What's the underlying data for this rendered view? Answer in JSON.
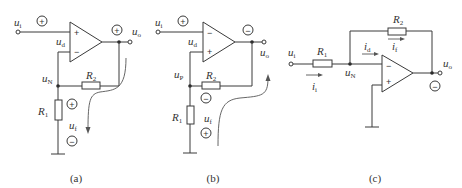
{
  "figure": {
    "panels": [
      {
        "id": "a",
        "caption": "(a)",
        "labels": {
          "input": "u",
          "input_sub": "i",
          "diff": "u",
          "diff_sub": "d",
          "node": "u",
          "node_sub": "N",
          "output": "u",
          "output_sub": "o",
          "r1": "R",
          "r1_sub": "1",
          "r2": "R",
          "r2_sub": "2",
          "feedback": "u",
          "feedback_sub": "f",
          "opamp_top": "+",
          "opamp_bottom": "−"
        },
        "polarity": {
          "input": "+",
          "output": "+",
          "feedback_top": "+",
          "feedback_bottom": "−"
        }
      },
      {
        "id": "b",
        "caption": "(b)",
        "labels": {
          "input": "u",
          "input_sub": "i",
          "diff": "u",
          "diff_sub": "d",
          "node": "u",
          "node_sub": "P",
          "output": "u",
          "output_sub": "o",
          "r1": "R",
          "r1_sub": "1",
          "r2": "R",
          "r2_sub": "2",
          "feedback": "u",
          "feedback_sub": "f",
          "opamp_top": "−",
          "opamp_bottom": "+"
        },
        "polarity": {
          "input": "+",
          "output": "−",
          "feedback_top": "−",
          "feedback_bottom": "+"
        }
      },
      {
        "id": "c",
        "caption": "(c)",
        "labels": {
          "input": "u",
          "input_sub": "i",
          "node": "u",
          "node_sub": "N",
          "output": "u",
          "output_sub": "o",
          "r1": "R",
          "r1_sub": "1",
          "r2": "R",
          "r2_sub": "2",
          "i_in": "i",
          "i_in_sub": "i",
          "i_d": "i",
          "i_d_sub": "d",
          "i_f": "i",
          "i_f_sub": "f",
          "opamp_top": "−",
          "opamp_bottom": "+"
        },
        "polarity": {
          "output": "−"
        }
      }
    ]
  }
}
